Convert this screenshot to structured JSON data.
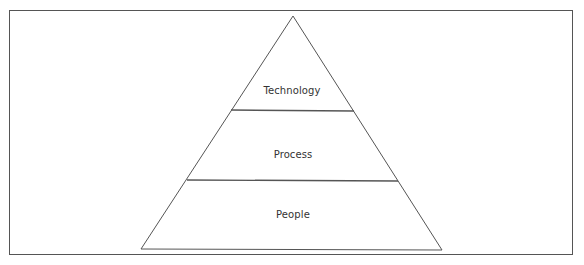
{
  "diagram": {
    "type": "pyramid",
    "levels": [
      {
        "id": "technology",
        "label": "Technology",
        "position": "top"
      },
      {
        "id": "process",
        "label": "Process",
        "position": "middle"
      },
      {
        "id": "people",
        "label": "People",
        "position": "bottom"
      }
    ],
    "colors": {
      "stroke": "#555555",
      "frame": "#555555",
      "text": "#333333",
      "fill": "#ffffff"
    }
  }
}
